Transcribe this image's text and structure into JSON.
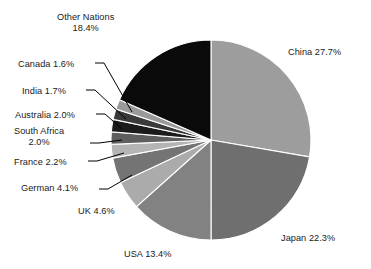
{
  "chart_data": {
    "type": "pie",
    "title": "",
    "subtitle": "",
    "xlabel": "",
    "ylabel": "",
    "legend_position": "none",
    "grid": false,
    "start_angle_deg": 0,
    "direction": "clockwise",
    "units": "percent",
    "categories": [
      "China",
      "Japan",
      "USA",
      "UK",
      "German",
      "France",
      "South Africa",
      "Australia",
      "India",
      "Canada",
      "Other Nations"
    ],
    "values": [
      27.7,
      22.3,
      13.4,
      4.6,
      4.1,
      2.2,
      2.0,
      2.0,
      1.7,
      1.6,
      18.4
    ],
    "colors": [
      "#9d9d9d",
      "#6f6f6f",
      "#828282",
      "#ababab",
      "#747474",
      "#b4b4b4",
      "#5e5e5e",
      "#1b1b1b",
      "#3a3a3a",
      "#9a9a9a",
      "#0a0a0a"
    ],
    "slices": [
      {
        "label": "China 27.7%",
        "name": "China",
        "value": 27.7,
        "color": "#9d9d9d",
        "label_x": 288,
        "label_y": 47,
        "label_align": "left",
        "leader": null
      },
      {
        "label": "Japan 22.3%",
        "name": "Japan",
        "value": 22.3,
        "color": "#6f6f6f",
        "label_x": 281,
        "label_y": 233,
        "label_align": "left",
        "leader": null
      },
      {
        "label": "USA 13.4%",
        "name": "USA",
        "value": 13.4,
        "color": "#828282",
        "label_x": 124,
        "label_y": 249,
        "label_align": "left",
        "leader": null
      },
      {
        "label": "UK 4.6%",
        "name": "UK",
        "value": 4.6,
        "color": "#ababab",
        "label_x": 78,
        "label_y": 206,
        "label_align": "left",
        "leader": null
      },
      {
        "label": "German 4.1%",
        "name": "German",
        "value": 4.1,
        "color": "#747474",
        "label_x": 21,
        "label_y": 183,
        "label_align": "left",
        "leader": "M 99,189 L 108,189 L 132,175"
      },
      {
        "label": "France 2.2%",
        "name": "France",
        "value": 2.2,
        "color": "#b4b4b4",
        "label_x": 14,
        "label_y": 157,
        "label_align": "left",
        "leader": "M 88,161 L 97,161 L 124,153"
      },
      {
        "label": "South Africa 2.0%",
        "name": "South Africa",
        "value": 2.0,
        "color": "#5e5e5e",
        "label_x": 14,
        "label_y": 126,
        "label_align": "left",
        "line1": "South Africa",
        "line2": "2.0%",
        "leader": "M 90,143 L 99,143 L 122,140"
      },
      {
        "label": "Australia 2.0%",
        "name": "Australia",
        "value": 2.0,
        "color": "#1b1b1b",
        "label_x": 15,
        "label_y": 110,
        "label_align": "left",
        "leader": "M 96,114 L 105,114 L 122,129"
      },
      {
        "label": "India 1.7%",
        "name": "India",
        "value": 1.7,
        "color": "#3a3a3a",
        "label_x": 22,
        "label_y": 86,
        "label_align": "left",
        "leader": "M 86,90 L 95,90 L 126,119"
      },
      {
        "label": "Canada 1.6%",
        "name": "Canada",
        "value": 1.6,
        "color": "#9a9a9a",
        "label_x": 18,
        "label_y": 59,
        "label_align": "left",
        "leader": "M 95,63 L 104,63 L 132,112"
      },
      {
        "label": "Other Nations 18.4%",
        "name": "Other Nations",
        "value": 18.4,
        "color": "#0a0a0a",
        "label_x": 57,
        "label_y": 12,
        "label_align": "center",
        "line1": "Other Nations",
        "line2": "18.4%",
        "leader": null
      }
    ],
    "geometry": {
      "cx": 211,
      "cy": 140,
      "r": 100
    }
  }
}
